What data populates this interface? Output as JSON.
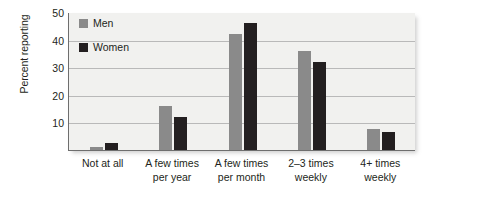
{
  "chart_data": {
    "type": "bar",
    "title": "",
    "xlabel": "",
    "ylabel": "Percent reporting",
    "ylim": [
      0,
      50
    ],
    "yticks": [
      50,
      40,
      30,
      20,
      10
    ],
    "grid": true,
    "legend_position": "top-left-inside",
    "categories": [
      {
        "line1": "Not at all",
        "line2": ""
      },
      {
        "line1": "A few times",
        "line2": "per year"
      },
      {
        "line1": "A few times",
        "line2": "per month"
      },
      {
        "line1": "2–3 times",
        "line2": "weekly"
      },
      {
        "line1": "4+ times",
        "line2": "weekly"
      }
    ],
    "category_labels": [
      "Not at all",
      "A few times per year",
      "A few times per month",
      "2–3 times weekly",
      "4+ times weekly"
    ],
    "series": [
      {
        "name": "Men",
        "color": "#8a8a8a",
        "values": [
          1,
          16,
          42,
          36,
          7.5
        ]
      },
      {
        "name": "Women",
        "color": "#231f20",
        "values": [
          2.5,
          12,
          46,
          32,
          6.5
        ]
      }
    ]
  },
  "legend": {
    "items": [
      {
        "label": "Men",
        "color": "#8a8a8a"
      },
      {
        "label": "Women",
        "color": "#231f20"
      }
    ]
  },
  "colors": {
    "panel_background": "#f1f1ef",
    "gridline": "#b9b9b9",
    "axis": "#6e6e6e",
    "text": "#231f20"
  }
}
